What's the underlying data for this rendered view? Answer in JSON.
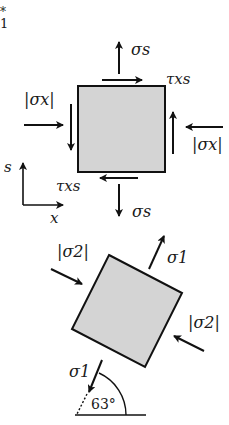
{
  "corner_mark": {
    "star": "*",
    "digit": "1"
  },
  "top_element": {
    "sigma_s_top": "σs",
    "tau_top": "τxs",
    "sigma_x_left": "|σx|",
    "sigma_x_right": "|σx|",
    "tau_bottom": "τxs",
    "sigma_s_bottom": "σs"
  },
  "axes": {
    "s_label": "s",
    "x_label": "x"
  },
  "bottom_element": {
    "sigma2_left": "|σ2|",
    "sigma1_top": "σ1",
    "sigma2_right": "|σ2|",
    "sigma1_bottom": "σ1",
    "angle": "63°"
  },
  "colors": {
    "fill": "#d4d4d4",
    "stroke": "#111111"
  }
}
